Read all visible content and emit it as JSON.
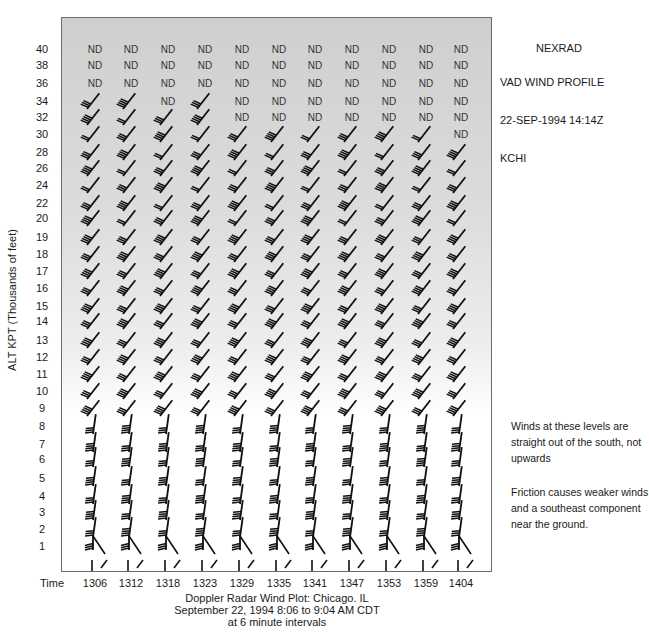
{
  "header": {
    "title": "NEXRAD",
    "subtitle": "VAD WIND PROFILE",
    "datetime": "22-SEP-1994 14:14Z",
    "station": "KCHI"
  },
  "axes": {
    "ylabel": "ALT KPT (Thousands of feet)",
    "xlabel_prefix": "Time",
    "yticks": [
      "40",
      "38",
      "36",
      "34",
      "32",
      "30",
      "28",
      "26",
      "24",
      "22",
      "20",
      "19",
      "18",
      "17",
      "16",
      "15",
      "14",
      "13",
      "12",
      "11",
      "10",
      "9",
      "8",
      "7",
      "6",
      "5",
      "4",
      "3",
      "2",
      "1"
    ],
    "xticks": [
      "1306",
      "1312",
      "1318",
      "1323",
      "1329",
      "1335",
      "1341",
      "1347",
      "1353",
      "1359",
      "1404"
    ]
  },
  "caption": {
    "line1": "Doppler Radar Wind Plot: Chicago. IL",
    "line2": "September 22, 1994 8:06 to 9:04 AM CDT",
    "line3": "at 6 minute intervals"
  },
  "notes": {
    "note1": "Winds at these levels are straight out of the south, not upwards",
    "note2": "Friction causes weaker winds and a southeast component near the ground."
  },
  "no_data_label": "ND",
  "chart_data": {
    "type": "wind_barb_time_height",
    "xlabel": "Time",
    "ylabel": "ALT KPT (Thousands of feet)",
    "x": [
      "1306",
      "1312",
      "1318",
      "1323",
      "1329",
      "1335",
      "1341",
      "1347",
      "1353",
      "1359",
      "1404"
    ],
    "y": [
      40,
      38,
      36,
      34,
      32,
      30,
      28,
      26,
      24,
      22,
      20,
      19,
      18,
      17,
      16,
      15,
      14,
      13,
      12,
      11,
      10,
      9,
      8,
      7,
      6,
      5,
      4,
      3,
      2,
      1
    ],
    "no_data": {
      "40": [
        "1306",
        "1312",
        "1318",
        "1323",
        "1329",
        "1335",
        "1341",
        "1347",
        "1353",
        "1359",
        "1404"
      ],
      "38": [
        "1306",
        "1312",
        "1318",
        "1323",
        "1329",
        "1335",
        "1341",
        "1347",
        "1353",
        "1359",
        "1404"
      ],
      "36": [
        "1306",
        "1312",
        "1318",
        "1323",
        "1329",
        "1335",
        "1341",
        "1347",
        "1353",
        "1359",
        "1404"
      ],
      "34": [
        "1318",
        "1329",
        "1335",
        "1341",
        "1347",
        "1353",
        "1359",
        "1404"
      ],
      "32": [
        "1329",
        "1335",
        "1341",
        "1347",
        "1353",
        "1359",
        "1404"
      ],
      "30": [
        "1404"
      ]
    },
    "annotations": [
      "Winds at these levels are straight out of the south, not upwards",
      "Friction causes weaker winds and a southeast component near the ground."
    ],
    "wind_regimes": [
      {
        "levels": "9-34",
        "direction": "southwest"
      },
      {
        "levels": "2-8",
        "direction": "south"
      },
      {
        "levels": "1",
        "direction": "southeast (weaker)"
      }
    ]
  }
}
